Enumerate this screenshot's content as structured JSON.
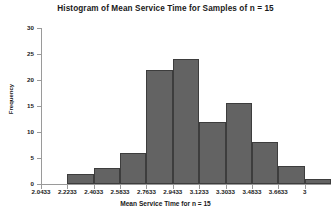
{
  "chart_data": {
    "type": "bar",
    "title": "Histogram of Mean Service Time for Samples of n = 15",
    "xlabel": "Mean Service Time for n = 15",
    "ylabel": "Frequency",
    "ylim": [
      0,
      30
    ],
    "yticks": [
      0,
      5,
      10,
      15,
      20,
      25,
      30
    ],
    "ytick_labels": [
      "0",
      "5",
      "10",
      "15",
      "20",
      "25",
      "30"
    ],
    "grid": false,
    "legend": null,
    "bin_edges": [
      2.0433,
      2.2233,
      2.4033,
      2.5833,
      2.7633,
      2.9433,
      3.1233,
      3.3033,
      3.4833,
      3.6633,
      3.8433,
      4.0233
    ],
    "xtick_labels": [
      "2.0433",
      "2.2233",
      "2.4033",
      "2.5833",
      "2.7633",
      "2.9433",
      "3.1233",
      "3.3033",
      "3.4833",
      "3.6633",
      "3"
    ],
    "categories": [
      "2.0433-2.2233",
      "2.2233-2.4033",
      "2.4033-2.5833",
      "2.5833-2.7633",
      "2.7633-2.9433",
      "2.9433-3.1233",
      "3.1233-3.3033",
      "3.3033-3.4833",
      "3.4833-3.6633",
      "3.6633-3.8433",
      "3.8433-4.0233"
    ],
    "values": [
      0,
      2,
      3,
      6,
      22,
      24,
      12,
      15.5,
      8,
      3.5,
      1
    ],
    "bar_color": "#636363",
    "bar_edge_color": "#3d3d3d",
    "axis_color": "#9a9a9a",
    "text_color": "#1a1a1a",
    "background": "#ffffff"
  }
}
